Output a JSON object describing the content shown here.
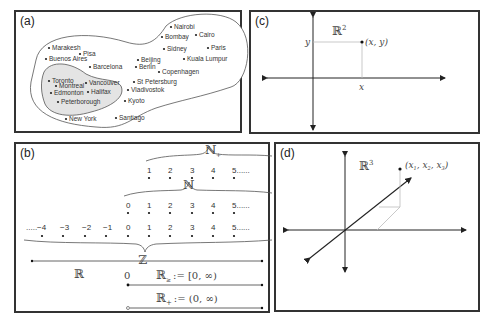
{
  "panels": {
    "a": {
      "label": "(a)",
      "outer_cities": [
        "Nairobi",
        "Bombay",
        "Cairo",
        "Sidney",
        "Paris",
        "Marakesh",
        "Pisa",
        "Buenos Aires",
        "Barcelona",
        "Beijing",
        "Berlin",
        "Kuala Lumpur",
        "Copenhagen",
        "St Petersburg",
        "Vladivostok",
        "Kyoto",
        "Santiago",
        "New York"
      ],
      "inner_cities": [
        "Toronto",
        "Montreal",
        "Vancouver",
        "Edmonton",
        "Halifax",
        "Peterborough"
      ],
      "c": {
        "nairobi": "Nairobi",
        "bombay": "Bombay",
        "cairo": "Cairo",
        "sidney": "Sidney",
        "paris": "Paris",
        "marakesh": "Marakesh",
        "pisa": "Pisa",
        "buenos": "Buenos Aires",
        "barcelona": "Barcelona",
        "beijing": "Beijing",
        "berlin": "Berlin",
        "kuala": "Kuala Lumpur",
        "copenhagen": "Copenhagen",
        "stpete": "St Petersburg",
        "vladivostok": "Vladivostok",
        "kyoto": "Kyoto",
        "santiago": "Santiago",
        "newyork": "New York",
        "toronto": "Toronto",
        "montreal": "Montreal",
        "vancouver": "Vancouver",
        "edmonton": "Edmonton",
        "halifax": "Halifax",
        "peterborough": "Peterborough"
      }
    },
    "b": {
      "label": "(b)",
      "nplus_label": "ℕ₊",
      "nplus_set": "ℕ",
      "nplus_sub": "+",
      "n_label": "ℕ",
      "z_label": "ℤ",
      "r_label": "ℝ",
      "nplus_values": [
        "1",
        "2",
        "3",
        "4",
        "5......"
      ],
      "n_values": [
        "0",
        "1",
        "2",
        "3",
        "4",
        "5......"
      ],
      "z_values": [
        ".....−4",
        "−3",
        "−2",
        "−1",
        "0",
        "1",
        "2",
        "3",
        "4",
        "5......"
      ],
      "zero_label": "0",
      "rnonneg_set": "ℝ",
      "rnonneg_sub": "≥",
      "rnonneg_def": ":= [0, ∞)",
      "rpos_set": "ℝ",
      "rpos_sub": "+",
      "rpos_def": ":= (0, ∞)"
    },
    "c": {
      "label": "(c)",
      "space": "ℝ",
      "space_exp": "2",
      "point": "(x, y)",
      "x_tick": "x",
      "y_tick": "y"
    },
    "d": {
      "label": "(d)",
      "space": "ℝ",
      "space_exp": "3",
      "point_open": "(x",
      "point_sub1": "1",
      "point_mid1": ", x",
      "point_sub2": "2",
      "point_mid2": ", x",
      "point_sub3": "3",
      "point_close": ")"
    }
  }
}
